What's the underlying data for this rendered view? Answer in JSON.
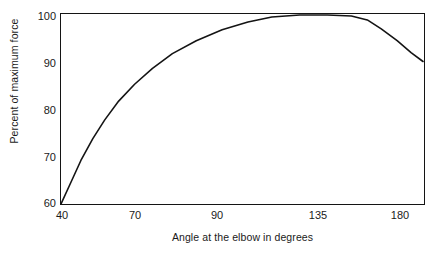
{
  "chart_data": {
    "type": "line",
    "title": "",
    "xlabel": "Angle at the elbow in degrees",
    "ylabel": "Percent of maximum force",
    "x_tick_labels": [
      "40",
      "70",
      "90",
      "135",
      "180"
    ],
    "x_tick_values": [
      40,
      70,
      90,
      135,
      180
    ],
    "y_tick_labels": [
      "60",
      "70",
      "80",
      "90",
      "100"
    ],
    "y_tick_values": [
      60,
      70,
      80,
      90,
      100
    ],
    "ylim": [
      59,
      101
    ],
    "xlim": [
      40,
      180
    ],
    "grid": false,
    "legend": false,
    "axis_scale_note": "x-axis ticks are evenly spaced by position, not value",
    "series": [
      {
        "name": "Percent of maximum force vs elbow angle",
        "x": [
          40,
          45,
          50,
          55,
          60,
          65,
          70,
          75,
          80,
          85,
          90,
          100,
          110,
          120,
          135,
          150,
          160,
          165,
          170,
          175,
          180
        ],
        "values": [
          59,
          64,
          69,
          73.5,
          77.5,
          80.5,
          83,
          86,
          89,
          91.5,
          93.5,
          96.5,
          98.5,
          99.8,
          100.5,
          100.5,
          100,
          99,
          97,
          94.5,
          92
        ]
      }
    ],
    "points_pixel_path": [
      [
        60,
        205
      ],
      [
        70,
        183
      ],
      [
        80,
        161
      ],
      [
        92,
        139
      ],
      [
        104,
        120
      ],
      [
        118,
        101
      ],
      [
        134,
        84
      ],
      [
        152,
        68
      ],
      [
        172,
        53
      ],
      [
        196,
        40
      ],
      [
        222,
        29
      ],
      [
        248,
        21
      ],
      [
        272,
        16
      ],
      [
        300,
        14
      ],
      [
        328,
        14
      ],
      [
        352,
        15
      ],
      [
        368,
        19
      ],
      [
        382,
        28
      ],
      [
        398,
        40
      ],
      [
        412,
        52
      ],
      [
        424,
        61
      ]
    ],
    "stroke_color": "#141414",
    "frame_color": "#141414",
    "background_color": "#ffffff"
  }
}
